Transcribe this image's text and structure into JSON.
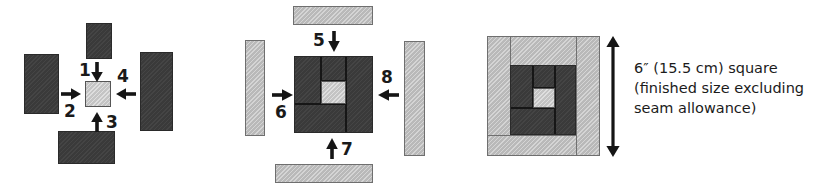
{
  "diagram": {
    "colors": {
      "dark_fabric": "#3a3a3a",
      "light_fabric": "#b9b9b9",
      "center_square": "#c4c4c4",
      "seam_line": "#161616",
      "text": "#1b1b1b"
    },
    "panels": [
      {
        "id": "panel-1",
        "name": "step-1-4-dark-round",
        "step_numbers": [
          "1",
          "2",
          "3",
          "4"
        ],
        "arrow_directions": [
          "down",
          "right",
          "up",
          "left"
        ]
      },
      {
        "id": "panel-2",
        "name": "step-5-8-light-round",
        "step_numbers": [
          "5",
          "6",
          "7",
          "8"
        ],
        "arrow_directions": [
          "down",
          "right",
          "up",
          "left"
        ]
      },
      {
        "id": "panel-3",
        "name": "finished-block",
        "measure_arrow": "vertical-double-arrow"
      }
    ],
    "numbers": {
      "n1": "1",
      "n2": "2",
      "n3": "3",
      "n4": "4",
      "n5": "5",
      "n6": "6",
      "n7": "7",
      "n8": "8"
    },
    "caption": "6″ (15.5 cm) square\n(finished size excluding\nseam allowance)"
  }
}
